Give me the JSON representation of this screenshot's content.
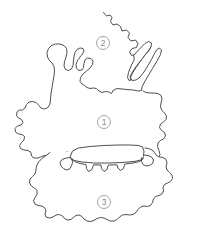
{
  "figure": {
    "background_color": "#ffffff",
    "outline_color": "#3a3a3a",
    "marker_color": "#8a8a8a",
    "width": 206,
    "height": 248
  },
  "markers": [
    {
      "id": "marker-1",
      "label": "1",
      "name": "region-marker-one",
      "cx": 104,
      "cy": 122,
      "r": 6.5
    },
    {
      "id": "marker-2",
      "label": "2",
      "name": "region-marker-two",
      "cx": 103,
      "cy": 43,
      "r": 6.5
    },
    {
      "id": "marker-3",
      "label": "3",
      "name": "region-marker-three",
      "cx": 104,
      "cy": 202,
      "r": 6.5
    }
  ],
  "shapes": {
    "upper_region": "M 103.5 12.5 L 106.5 16.0 L 110.0 15.0 L 112.0 17.5 L 110.5 21.5 L 113.0 25.0 L 117.0 24.0 L 120.5 26.5 L 122.0 31.0 L 126.5 30.0 L 129.5 33.0 L 128.0 37.5 L 131.0 41.0 L 135.5 40.0 L 138.0 43.5 L 136.5 47.5 L 132.0 48.5 L 129.5 52.0 L 131.5 55.5 L 136.5 54.0 L 140.0 50.0 L 144.5 45.5 L 148.0 44.0 L 151.0 46.5 L 149.0 50.5 L 144.5 55.5 L 140.0 61.5 L 136.0 67.5 L 132.5 73.0 L 130.5 77.5 L 132.0 80.5 L 136.0 80.0 L 140.0 77.0 L 144.0 72.0 L 148.0 65.5 L 151.5 59.5 L 154.5 53.5 L 157.0 49.5 L 159.5 48.0 L 161.5 50.0 L 160.5 54.5 L 157.0 61.0 L 152.5 68.5 L 148.0 76.0 L 144.5 82.0 L 142.0 87.0 L 141.5 90.5 L 138.0 91.0 L 133.0 90.0 L 127.0 89.5 L 122.0 89.0 L 117.0 88.5 L 113.0 90.5 L 111.5 93.5 L 109.0 92.0 L 105.5 91.5 L 102.0 92.5 L 99.0 91.0 L 96.5 88.5 L 93.5 88.0 L 90.0 88.5 L 87.0 87.5 L 84.5 85.5 L 82.0 84.0 L 80.0 81.5 L 80.5 77.5 L 83.0 74.0 L 86.5 71.0 L 90.0 68.0 L 92.5 64.5 L 93.0 61.0 L 91.0 58.5 L 87.5 58.0 L 85.0 60.0 L 84.0 63.5 L 83.5 67.5 L 82.0 70.0 L 79.0 70.5 L 76.5 68.5 L 76.0 64.5 L 77.5 60.5 L 80.0 57.0 L 82.5 54.0 L 84.0 51.0 L 83.0 48.5 L 80.0 48.0 L 77.0 49.5 L 75.0 52.5 L 74.0 56.5 L 73.5 61.0 L 73.0 65.5 L 71.5 69.0 L 68.5 70.5 L 65.5 69.5 L 64.0 66.0 L 64.5 61.5 L 66.0 57.0 L 67.0 52.5 L 66.5 48.5 L 64.0 45.5 L 60.0 44.0 L 55.5 44.0 L 51.5 45.5 L 48.5 48.5 L 47.0 52.5 L 47.5 57.0 L 49.5 60.5 L 52.0 63.0 L 54.0 66.5 L 54.5 71.0 L 54.0 76.0 L 53.0 81.5 L 52.0 87.5 L 51.0 93.5 L 50.5 99.0 L 50.0 104.0 L 48.0 107.5 L 44.5 109.0 L 41.0 108.0 L 38.5 105.0 L 36.0 102.5 L 32.5 101.5 L 29.0 102.0 L 26.5 104.5 L 25.0 108.0 L 22.5 110.0 L 19.5 110.0 L 17.0 112.0 L 16.5 115.5 L 18.5 118.0 L 21.5 119.5 L 23.0 122.5 L 21.0 125.0 L 17.5 126.0 L 15.0 128.5 L 15.5 132.0 L 18.5 134.0 L 22.0 134.5 L 24.5 136.5 L 24.0 140.0 L 21.5 142.5 L 19.5 145.5 L 20.5 148.5 L 24.0 150.0 L 28.0 150.5 L 31.0 152.5 L 31.5 156.0 L 34.0 158.0 L 38.0 158.0 L 41.5 156.5 L 45.0 155.5 L 48.5 156.0 L 51.5 157.5 L 55.0 158.5 L 58.5 158.0 L 61.5 156.0 L 64.0 153.5 L 66.5 152.0 L 70.0 152.5 L 72.5 154.5 L 74.0 157.5 L 77.0 159.5 L 80.5 159.0 L 83.0 156.5 L 85.5 154.5 L 89.0 154.0 L 94.0 153.5 L 100.0 153.0 L 107.0 152.5 L 114.0 152.0 L 121.0 151.5 L 128.0 151.0 L 134.0 150.5 L 139.0 150.5 L 143.0 151.5 L 146.5 153.5 L 149.5 156.0 L 152.0 158.5 L 155.5 159.5 L 158.5 158.0 L 160.0 154.5 L 159.0 150.5 L 157.5 146.5 L 158.0 143.0 L 160.5 140.5 L 163.5 139.0 L 165.5 136.0 L 164.5 132.5 L 161.5 130.5 L 159.5 127.5 L 160.5 124.0 L 163.5 122.0 L 166.0 119.5 L 166.5 116.0 L 164.5 113.0 L 162.0 110.5 L 160.5 107.0 L 161.0 103.0 L 162.0 99.0 L 161.0 95.5 L 158.0 93.5 L 154.0 93.0 L 150.0 93.0 L 146.0 92.5 L 143.0 91.0",
    "lower_region": "M 50.0 152.5 L 46.0 155.5 L 42.0 158.5 L 38.5 162.0 L 36.5 166.0 L 36.0 170.0 L 35.0 174.0 L 32.5 176.5 L 30.0 179.0 L 29.5 183.0 L 31.5 186.0 L 34.5 188.0 L 37.0 190.5 L 37.0 194.5 L 35.0 197.5 L 33.5 201.0 L 35.0 204.0 L 38.0 205.5 L 41.5 206.0 L 44.5 207.5 L 46.0 210.5 L 45.0 214.0 L 46.0 217.0 L 49.5 218.0 L 53.0 217.0 L 56.0 215.0 L 59.5 214.5 L 62.5 216.0 L 64.5 218.5 L 67.5 220.0 L 71.0 219.5 L 73.5 217.5 L 76.0 215.5 L 79.0 215.0 L 82.0 216.5 L 84.0 219.0 L 87.0 221.0 L 90.5 221.5 L 94.0 220.5 L 97.0 218.5 L 100.5 217.5 L 104.0 218.0 L 107.0 219.5 L 110.5 221.0 L 114.0 221.0 L 117.0 219.5 L 119.5 217.0 L 122.5 215.0 L 126.0 214.5 L 129.5 215.0 L 133.0 214.5 L 136.0 212.5 L 138.0 209.5 L 140.5 207.0 L 144.0 206.0 L 147.5 206.5 L 150.5 205.5 L 152.5 202.5 L 153.5 199.0 L 155.5 196.5 L 159.0 195.5 L 162.0 194.0 L 163.5 191.0 L 163.0 187.5 L 164.5 184.5 L 167.5 183.0 L 170.5 181.5 L 172.5 178.5 L 172.0 175.0 L 169.5 172.5 L 167.0 170.0 L 166.0 166.5 L 167.0 163.0 L 166.0 159.5 L 163.0 157.5 L 159.5 157.0 L 156.5 155.5 L 154.5 152.5 L 152.0 150.0 L 148.5 148.5 L 145.0 148.0",
    "center_panel": "M 70.5 156.0 L 72.5 151.0 L 78.5 148.0 L 90.0 146.5 L 104.0 145.5 L 118.0 145.0 L 130.0 145.0 L 138.5 145.5 L 142.5 147.0 L 144.0 151.0 L 143.5 156.5 L 141.0 160.0 L 134.0 161.5 L 122.0 162.5 L 108.0 163.0 L 94.0 163.0 L 82.0 162.0 L 74.5 160.5 L 71.0 158.5 Z",
    "center_skirt": "M 71.0 159.0 L 74.5 161.5 L 80.0 163.5 L 86.0 164.5 L 86.5 168.5 L 88.5 171.5 L 91.5 170.0 L 93.0 166.5 L 93.5 164.8 L 101.0 165.0 L 101.5 168.5 L 104.0 171.5 L 107.0 169.5 L 108.0 166.0 L 108.5 165.0 L 117.0 164.8 L 118.0 168.0 L 120.5 170.5 L 123.5 168.5 L 124.5 165.0 L 125.0 164.0 L 133.0 163.0 L 139.5 161.5 L 143.5 158.5",
    "center_left_spur": "M 70.5 157.5 L 66.0 158.0 L 62.0 159.5 L 60.0 162.5 L 61.0 166.0 L 63.5 168.5 L 66.5 170.0 L 69.5 169.0 L 71.5 166.0 L 72.5 162.5 L 72.0 159.0",
    "center_right_spur": "M 144.0 155.0 L 148.0 155.5 L 151.5 157.0 L 153.5 160.0 L 152.5 163.5 L 149.5 165.5 L 146.0 166.0 L 143.0 164.5 L 141.5 161.5 L 141.5 158.0",
    "upper_finger": "M 134.0 55.0 L 139.5 49.0 L 145.0 43.5 L 148.5 41.5 L 151.5 43.0 L 151.0 47.0 L 147.0 52.5 L 141.5 59.5 L 136.5 66.0 L 132.5 72.0 L 130.0 77.0 L 131.0 80.0 L 129.0 80.5 L 127.5 77.5 L 128.5 72.5 L 131.0 66.0 L 134.0 60.0 Z"
  }
}
